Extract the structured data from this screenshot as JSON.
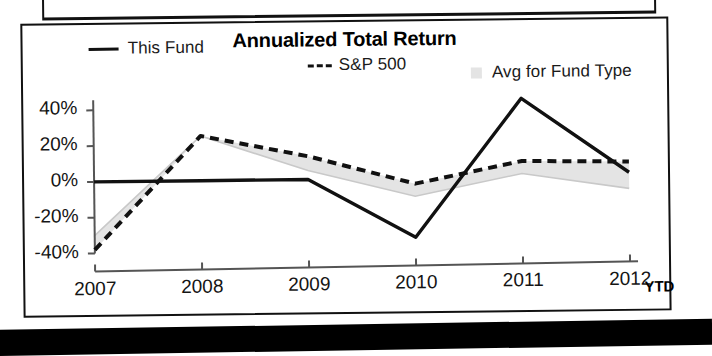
{
  "chart_data": {
    "type": "line",
    "title": "Annualized Total Return",
    "xlabel": "",
    "ylabel": "",
    "categories": [
      "2007",
      "2008",
      "2009",
      "2010",
      "2011",
      "2012"
    ],
    "x_tick_labels": [
      "2007",
      "2008",
      "2009",
      "2010",
      "2011",
      "2012"
    ],
    "x_axis_suffix": "YTD",
    "y_tick_labels": [
      "40%",
      "20%",
      "0%",
      "-20%",
      "-40%"
    ],
    "y_tick_values": [
      40,
      20,
      0,
      -20,
      -40
    ],
    "ylim": [
      -45,
      48
    ],
    "grid": false,
    "legend_position": "top",
    "series": [
      {
        "name": "This Fund",
        "style": "solid",
        "color": "#111111",
        "values": [
          0,
          0,
          0,
          -33,
          44,
          2
        ]
      },
      {
        "name": "S&P 500",
        "style": "dashed",
        "color": "#111111",
        "values": [
          -38,
          25,
          13,
          -3,
          9,
          8
        ]
      },
      {
        "name": "Avg for Fund Type",
        "style": "shaded-band",
        "color": "#e4e4e4",
        "values": [
          -30,
          25,
          5,
          -10,
          2,
          -7
        ]
      }
    ],
    "legend": [
      {
        "label": "This Fund",
        "marker": "solid-line"
      },
      {
        "label": "S&P 500",
        "marker": "dashed-line"
      },
      {
        "label": "Avg for Fund Type",
        "marker": "gray-square"
      }
    ]
  },
  "colors": {
    "line": "#111111",
    "band": "#e4e4e4",
    "axis": "#555555",
    "frame": "#111111",
    "text": "#151515"
  }
}
